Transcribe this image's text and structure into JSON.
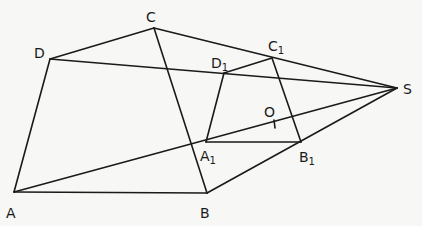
{
  "diagram": {
    "points": {
      "A": {
        "label": "A"
      },
      "B": {
        "label": "B"
      },
      "C": {
        "label": "C"
      },
      "D": {
        "label": "D"
      },
      "A1": {
        "label": "A",
        "sub": "1"
      },
      "B1": {
        "label": "B",
        "sub": "1"
      },
      "C1": {
        "label": "C",
        "sub": "1"
      },
      "D1": {
        "label": "D",
        "sub": "1"
      },
      "S": {
        "label": "S"
      },
      "O": {
        "label": "O"
      }
    },
    "segments": [
      [
        "A",
        "B"
      ],
      [
        "B",
        "C"
      ],
      [
        "C",
        "D"
      ],
      [
        "D",
        "A"
      ],
      [
        "A1",
        "B1"
      ],
      [
        "B1",
        "C1"
      ],
      [
        "C1",
        "D1"
      ],
      [
        "D1",
        "A1"
      ],
      [
        "A",
        "S"
      ],
      [
        "B",
        "S"
      ],
      [
        "C",
        "S"
      ],
      [
        "D",
        "S"
      ]
    ]
  }
}
